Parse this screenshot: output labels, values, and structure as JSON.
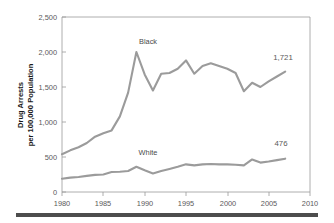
{
  "figure": {
    "background_color": "#ffffff",
    "line_color": "#9b9b9b",
    "axis_color": "#9a9a9a",
    "rule_color": "#4d4d4d",
    "ylabel_line1": "Drug Arrests",
    "ylabel_line2": "per 100,000 Population"
  },
  "chart_data": {
    "type": "line",
    "title": "",
    "xlabel": "",
    "ylabel": "Drug Arrests per 100,000 Population",
    "xlim": [
      1980,
      2010
    ],
    "ylim": [
      0,
      2500
    ],
    "grid": false,
    "legend_position": "inline-annotations",
    "xticks": [
      1980,
      1985,
      1990,
      1995,
      2000,
      2005,
      2010
    ],
    "xtick_labels": [
      "1980",
      "1985",
      "1990",
      "1995",
      "2000",
      "2005",
      "2010"
    ],
    "yticks": [
      0,
      500,
      1000,
      1500,
      2000,
      2500
    ],
    "ytick_labels": [
      "0",
      "500",
      "1,000",
      "1,500",
      "2,000",
      "2,500"
    ],
    "x": [
      1980,
      1981,
      1982,
      1983,
      1984,
      1985,
      1986,
      1987,
      1988,
      1989,
      1990,
      1991,
      1992,
      1993,
      1994,
      1995,
      1996,
      1997,
      1998,
      1999,
      2000,
      2001,
      2002,
      2003,
      2004,
      2005,
      2006,
      2007
    ],
    "series": [
      {
        "name": "Black",
        "label": "Black",
        "end_value_label": "1,721",
        "values": [
          540,
          595,
          640,
          700,
          790,
          840,
          880,
          1080,
          1420,
          2000,
          1680,
          1450,
          1690,
          1700,
          1760,
          1880,
          1690,
          1800,
          1840,
          1800,
          1760,
          1700,
          1440,
          1560,
          1500,
          1580,
          1650,
          1721
        ]
      },
      {
        "name": "White",
        "label": "White",
        "end_value_label": "476",
        "values": [
          190,
          205,
          215,
          230,
          245,
          250,
          285,
          290,
          300,
          360,
          310,
          265,
          300,
          330,
          360,
          395,
          380,
          395,
          400,
          395,
          395,
          390,
          380,
          465,
          420,
          435,
          455,
          476
        ]
      }
    ],
    "annotations": [
      {
        "text": "Black",
        "series": "Black",
        "anchor_year": 1989,
        "position": "above-peak"
      },
      {
        "text": "White",
        "series": "White",
        "anchor_year": 1989,
        "position": "above"
      },
      {
        "text": "1,721",
        "series": "Black",
        "anchor_year": 2007,
        "position": "right-end"
      },
      {
        "text": "476",
        "series": "White",
        "anchor_year": 2007,
        "position": "right-end"
      }
    ]
  }
}
